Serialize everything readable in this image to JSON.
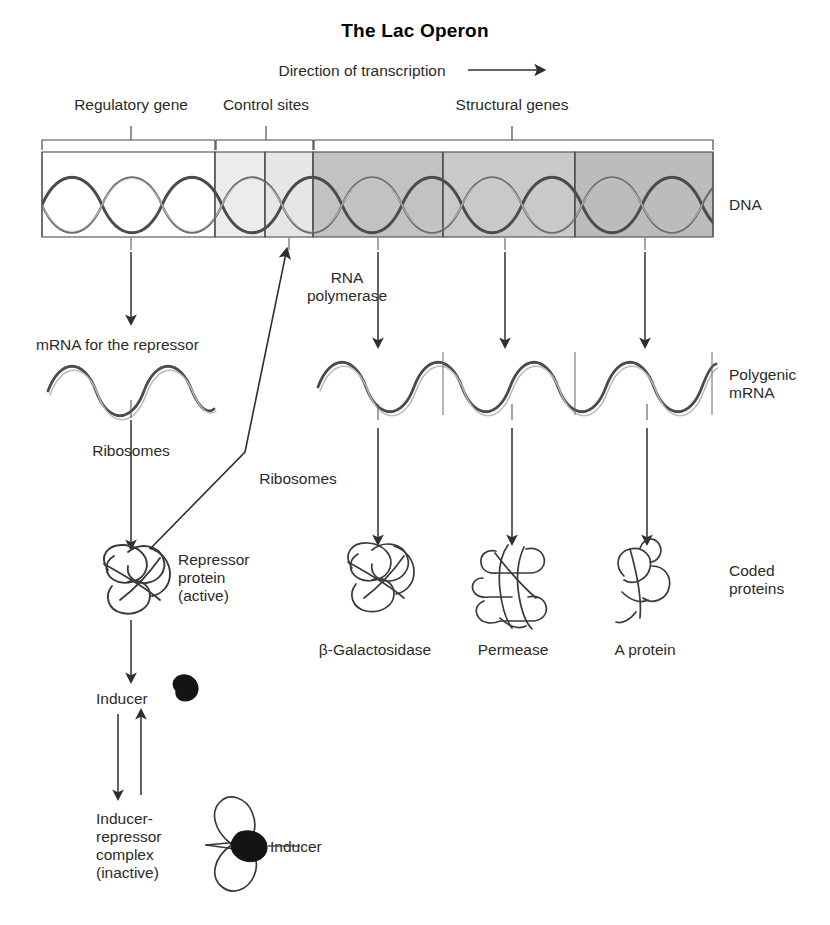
{
  "title": "The Lac Operon",
  "direction_label": "Direction of transcription",
  "brackets": [
    {
      "label": "Regulatory gene"
    },
    {
      "label": "Control sites"
    },
    {
      "label": "Structural genes"
    }
  ],
  "dna": {
    "row_label": "DNA",
    "segments": [
      {
        "letter": "i",
        "shade": "#ffffff"
      },
      {
        "letter": "p",
        "shade": "#ececec"
      },
      {
        "letter": "o",
        "shade": "#e6e6e6"
      },
      {
        "letter": "z",
        "shade": "#c2c2c2"
      },
      {
        "letter": "y",
        "shade": "#c9c9c9"
      },
      {
        "letter": "a",
        "shade": "#bcbcbc"
      }
    ]
  },
  "transcription": {
    "rna_polymerase_line1": "RNA",
    "rna_polymerase_line2": "polymerase",
    "repressor_mrna_label": "mRNA for the repressor",
    "polygenic_mrna_line1": "Polygenic",
    "polygenic_mrna_line2": "mRNA"
  },
  "translation": {
    "ribosomes_left": "Ribosomes",
    "ribosomes_right": "Ribosomes",
    "coded_proteins_line1": "Coded",
    "coded_proteins_line2": "proteins"
  },
  "proteins": [
    {
      "name": "β-Galactosidase"
    },
    {
      "name": "Permease"
    },
    {
      "name": "A protein"
    }
  ],
  "repressor": {
    "line1": "Repressor",
    "line2": "protein",
    "line3": "(active)"
  },
  "inducer": {
    "label": "Inducer",
    "callout_label": "Inducer"
  },
  "complex": {
    "line1": "Inducer-",
    "line2": "repressor",
    "line3": "complex",
    "line4": "(inactive)"
  },
  "colors": {
    "ink": "#2b2b2b",
    "line": "#3a3a3a",
    "molecule": "#141414"
  }
}
